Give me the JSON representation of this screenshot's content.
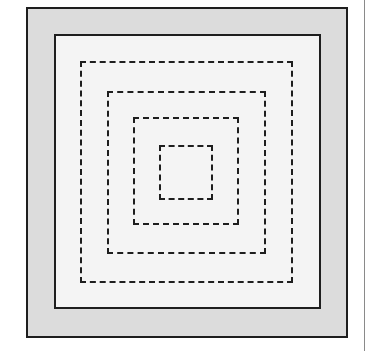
{
  "diagram": {
    "type": "nested-squares",
    "colors": {
      "stroke": "#1e1e1e",
      "outer_fill": "#dcdcdc",
      "inner_fill": "#f4f4f4",
      "background": "#ffffff",
      "edge_line": "#8a8a8a"
    },
    "outer_square": {
      "style": "solid",
      "x": 26,
      "y": 7,
      "w": 322,
      "h": 331
    },
    "inner_square": {
      "style": "solid",
      "x": 54,
      "y": 34,
      "w": 267,
      "h": 275
    },
    "dashed_squares": [
      {
        "x": 80,
        "y": 61,
        "w": 213,
        "h": 222
      },
      {
        "x": 107,
        "y": 91,
        "w": 159,
        "h": 163
      },
      {
        "x": 133,
        "y": 117,
        "w": 106,
        "h": 108
      },
      {
        "x": 159,
        "y": 145,
        "w": 54,
        "h": 55
      }
    ],
    "right_edge_line": {
      "x": 364,
      "y": 0,
      "h": 351
    }
  }
}
